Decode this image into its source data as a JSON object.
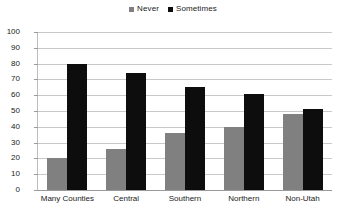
{
  "chart_data": {
    "type": "bar",
    "title": "",
    "xlabel": "",
    "ylabel": "",
    "ylim": [
      0,
      100
    ],
    "ytick_step": 10,
    "ytick_labels": [
      "100",
      "90",
      "80",
      "70",
      "60",
      "50",
      "40",
      "30",
      "20",
      "10",
      "0"
    ],
    "grid": true,
    "legend_position": "top-center",
    "categories": [
      "Many Counties",
      "Central",
      "Southern",
      "Northern",
      "Non-Utah"
    ],
    "series": [
      {
        "name": "Never",
        "color": "#808080",
        "values": [
          20,
          26,
          36,
          40,
          48
        ]
      },
      {
        "name": "Sometimes",
        "color": "#0d0d0d",
        "values": [
          80,
          74,
          65,
          61,
          51
        ]
      }
    ]
  },
  "legend": {
    "items": [
      {
        "label": "Never",
        "color": "#808080",
        "marker": "square-marker"
      },
      {
        "label": "Sometimes",
        "color": "#0d0d0d",
        "marker": "square-marker"
      }
    ]
  },
  "axes": {
    "y": {
      "ticks": [
        {
          "label": "100",
          "value": 100
        },
        {
          "label": "90",
          "value": 90
        },
        {
          "label": "80",
          "value": 80
        },
        {
          "label": "70",
          "value": 70
        },
        {
          "label": "60",
          "value": 60
        },
        {
          "label": "50",
          "value": 50
        },
        {
          "label": "40",
          "value": 40
        },
        {
          "label": "30",
          "value": 30
        },
        {
          "label": "20",
          "value": 20
        },
        {
          "label": "10",
          "value": 10
        },
        {
          "label": "0",
          "value": 0
        }
      ]
    },
    "x": {
      "ticks": [
        {
          "label": "Many Counties"
        },
        {
          "label": "Central"
        },
        {
          "label": "Southern"
        },
        {
          "label": "Northern"
        },
        {
          "label": "Non-Utah"
        }
      ]
    }
  },
  "colors": {
    "never": "#808080",
    "sometimes": "#0d0d0d",
    "gridline": "#c9c9c9",
    "axis": "#9a9a9a",
    "background": "#ffffff"
  }
}
